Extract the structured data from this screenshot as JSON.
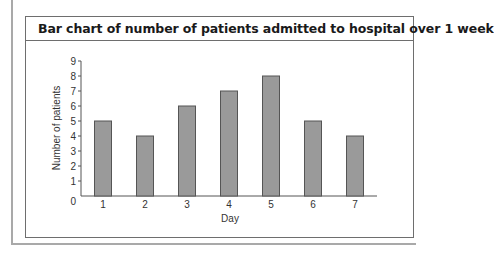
{
  "card": {
    "title": "Bar chart of number of patients admitted to hospital over 1 week"
  },
  "colors": {
    "bar_fill": "#9a9a9a",
    "bar_stroke": "#555555",
    "axis": "#555555",
    "frame": "#6e6e6e"
  },
  "chart_data": {
    "type": "bar",
    "title": "Bar chart of number of patients admitted to hospital over 1 week",
    "xlabel": "Day",
    "ylabel": "Number of patients",
    "categories": [
      "1",
      "2",
      "3",
      "4",
      "5",
      "6",
      "7"
    ],
    "values": [
      5,
      4,
      6,
      7,
      8,
      5,
      4
    ],
    "ylim": [
      0,
      9
    ],
    "yticks": [
      0,
      1,
      2,
      3,
      4,
      5,
      6,
      7,
      8,
      9
    ],
    "grid": false,
    "legend": null
  }
}
